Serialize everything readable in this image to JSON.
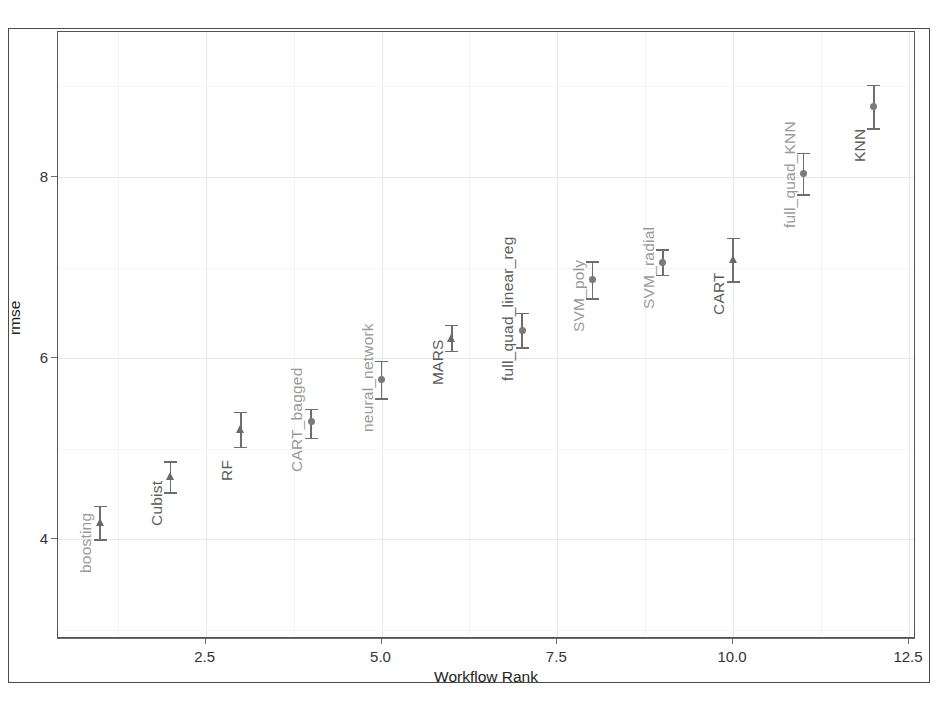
{
  "chart_data": {
    "type": "scatter",
    "title": "",
    "xlabel": "Workflow Rank",
    "ylabel": "rmse",
    "xlim": [
      0.4,
      12.6
    ],
    "ylim": [
      2.9,
      9.6
    ],
    "grid": true,
    "legend": "none",
    "xticks": [
      "2.5",
      "5.0",
      "7.5",
      "10.0",
      "12.5"
    ],
    "xtick_values": [
      2.5,
      5.0,
      7.5,
      10.0,
      12.5
    ],
    "yticks": [
      "4",
      "6",
      "8"
    ],
    "ytick_values": [
      4,
      6,
      8
    ],
    "error_bars": "vertical",
    "points": [
      {
        "label": "boosting",
        "x": 1,
        "y": 4.19,
        "low": 4.0,
        "high": 4.37,
        "marker": "triangle"
      },
      {
        "label": "Cubist",
        "x": 2,
        "y": 4.7,
        "low": 4.52,
        "high": 4.86,
        "marker": "triangle"
      },
      {
        "label": "RF",
        "x": 3,
        "y": 5.22,
        "low": 5.02,
        "high": 5.41,
        "marker": "triangle"
      },
      {
        "label": "CART_bagged",
        "x": 4,
        "y": 5.3,
        "low": 5.12,
        "high": 5.44,
        "marker": "circle"
      },
      {
        "label": "neural_network",
        "x": 5,
        "y": 5.77,
        "low": 5.56,
        "high": 5.97,
        "marker": "circle"
      },
      {
        "label": "MARS",
        "x": 6,
        "y": 6.22,
        "low": 6.08,
        "high": 6.37,
        "marker": "triangle"
      },
      {
        "label": "full_quad_linear_reg",
        "x": 7,
        "y": 6.31,
        "low": 6.12,
        "high": 6.5,
        "marker": "circle"
      },
      {
        "label": "SVM_poly",
        "x": 8,
        "y": 6.87,
        "low": 6.66,
        "high": 7.07,
        "marker": "circle"
      },
      {
        "label": "SVM_radial",
        "x": 9,
        "y": 7.06,
        "low": 6.92,
        "high": 7.2,
        "marker": "circle"
      },
      {
        "label": "CART",
        "x": 10,
        "y": 7.09,
        "low": 6.85,
        "high": 7.33,
        "marker": "triangle"
      },
      {
        "label": "full_quad_KNN",
        "x": 11,
        "y": 8.04,
        "low": 7.81,
        "high": 8.27,
        "marker": "circle"
      },
      {
        "label": "KNN",
        "x": 12,
        "y": 8.78,
        "low": 8.54,
        "high": 9.02,
        "marker": "circle"
      }
    ]
  },
  "style": {
    "point_color": "#7a7a7a",
    "label_color_light": "#9a9a9a",
    "label_color_dark": "#5c5c5c",
    "grid_color": "#e8e8e8",
    "panel_border_color": "#555555",
    "background": "#ffffff"
  },
  "label_shades": [
    "light",
    "dark",
    "dark",
    "light",
    "light",
    "dark",
    "dark",
    "light",
    "light",
    "dark",
    "light",
    "dark"
  ]
}
